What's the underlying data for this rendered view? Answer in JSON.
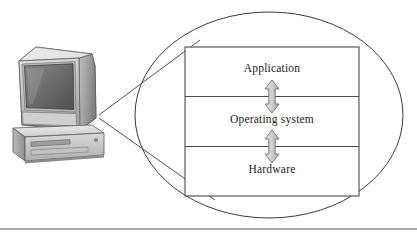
{
  "figure": {
    "background_color": "#ffffff",
    "outline_color": "#3b3b3b",
    "rule_color": "#555555"
  },
  "illustration": {
    "name": "desktop-computer",
    "description": "CRT monitor resting on a horizontal desktop PC case",
    "monitor_screen_color": "#6d6d6d",
    "case_body_color": "#d8d8d8",
    "bezel_color": "#c9c9c9",
    "shadow_color": "#8e8e8e"
  },
  "callout": {
    "name": "magnifier-callout",
    "shape": "ellipse",
    "line_count": 2
  },
  "layers": [
    {
      "id": "application",
      "label": "Application"
    },
    {
      "id": "operating-system",
      "label": "Operating system"
    },
    {
      "id": "hardware",
      "label": "Hardware"
    }
  ],
  "arrows": [
    {
      "id": "application-os-arrow",
      "direction": "bidirectional",
      "between": "Application / Operating system",
      "fill": "#cccccc",
      "stroke": "#6b6b6b"
    },
    {
      "id": "os-hardware-arrow",
      "direction": "bidirectional",
      "between": "Operating system / Hardware",
      "fill": "#cccccc",
      "stroke": "#6b6b6b"
    }
  ],
  "footer_rule": {
    "name": "footer-rule",
    "visible": true
  }
}
